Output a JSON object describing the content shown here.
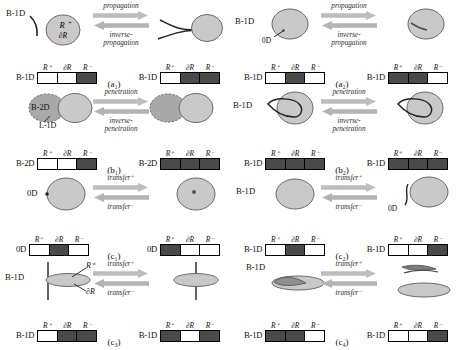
{
  "figure": {
    "column_headers": [
      "R⁺",
      "∂R",
      "R⁻"
    ],
    "arrow_colors": {
      "right": "#bdbdbd",
      "left": "#b3b3b3"
    },
    "shape_colors": {
      "light": "#c9c9c9",
      "dark": "#a9a9a9",
      "outline": "#6a6a6a"
    }
  },
  "panels": [
    {
      "id": "a1",
      "caption": "(a₁)",
      "forward_label": "propagation",
      "reverse_label": "inverse-\npropagation",
      "left": {
        "dim_label": "B-1D",
        "annotations": [
          "B-1D",
          "R⁺",
          "∂R"
        ],
        "cells": [
          false,
          false,
          true
        ]
      },
      "right": {
        "dim_label": "B-1D",
        "annotations": [],
        "cells": [
          false,
          true,
          true
        ]
      }
    },
    {
      "id": "a2",
      "caption": "(a₂)",
      "forward_label": "propagation",
      "reverse_label": "inverse-\npropagation",
      "left": {
        "dim_label": "B-1D",
        "annotations": [
          "B-1D",
          "0D"
        ],
        "cells": [
          false,
          true,
          false
        ]
      },
      "right": {
        "dim_label": "B-1D",
        "annotations": [],
        "cells": [
          true,
          true,
          false
        ]
      }
    },
    {
      "id": "b1",
      "caption": "(b₁)",
      "forward_label": "penetration",
      "reverse_label": "inverse-\npenetration",
      "left": {
        "dim_label": "B-2D",
        "annotations": [
          "B-2D",
          "L-1D"
        ],
        "cells": [
          false,
          false,
          true
        ]
      },
      "right": {
        "dim_label": "B-2D",
        "annotations": [],
        "cells": [
          true,
          true,
          true
        ]
      }
    },
    {
      "id": "b2",
      "caption": "(b₂)",
      "forward_label": "penetration",
      "reverse_label": "inverse-\npenetration",
      "left": {
        "dim_label": "B-1D",
        "annotations": [
          "B-1D"
        ],
        "cells": [
          true,
          true,
          true
        ]
      },
      "right": {
        "dim_label": "B-1D",
        "annotations": [],
        "cells": [
          true,
          true,
          true
        ]
      }
    },
    {
      "id": "c1",
      "caption": "(c₁)",
      "forward_label": "transfer⁺",
      "reverse_label": "transfer⁻",
      "left": {
        "dim_label": "0D",
        "annotations": [
          "0D"
        ],
        "cells": [
          false,
          true,
          false
        ]
      },
      "right": {
        "dim_label": "0D",
        "annotations": [],
        "cells": [
          true,
          false,
          false
        ]
      }
    },
    {
      "id": "c2",
      "caption": "(c₂)",
      "forward_label": "transfer⁺",
      "reverse_label": "transfer⁻",
      "left": {
        "dim_label": "B-1D",
        "annotations": [
          "B-1D"
        ],
        "cells": [
          false,
          true,
          false
        ]
      },
      "right": {
        "dim_label": "B-1D",
        "annotations": [
          "0D"
        ],
        "cells": [
          false,
          false,
          true
        ]
      }
    },
    {
      "id": "c3",
      "caption": "(c₃)",
      "forward_label": "transfer⁺",
      "reverse_label": "transfer⁻",
      "left": {
        "dim_label": "B-1D",
        "annotations": [
          "B-1D",
          "R⁺",
          "∂R"
        ],
        "cells": [
          false,
          true,
          true
        ]
      },
      "right": {
        "dim_label": "B-1D",
        "annotations": [],
        "cells": [
          true,
          false,
          true
        ]
      }
    },
    {
      "id": "c4",
      "caption": "(c₄)",
      "forward_label": "transfer⁺",
      "reverse_label": "transfer⁻",
      "left": {
        "dim_label": "B-1D",
        "annotations": [
          "B-1D"
        ],
        "cells": [
          true,
          true,
          false
        ]
      },
      "right": {
        "dim_label": "B-1D",
        "annotations": [],
        "cells": [
          false,
          false,
          true
        ]
      }
    }
  ]
}
